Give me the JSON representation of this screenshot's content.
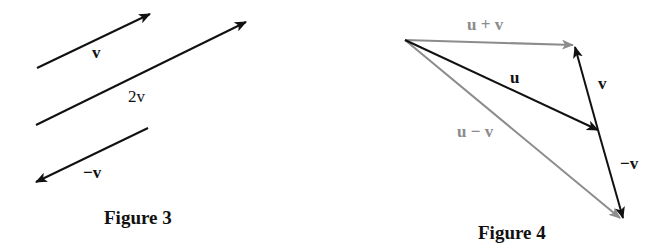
{
  "figures": [
    {
      "caption": "Figure 3",
      "vectors": [
        {
          "name": "v",
          "label": "v",
          "from": [
            37,
            68
          ],
          "to": [
            150,
            14
          ],
          "color": "#111111"
        },
        {
          "name": "2v",
          "label": "2v",
          "from": [
            36,
            125
          ],
          "to": [
            246,
            22
          ],
          "color": "#111111"
        },
        {
          "name": "neg-v",
          "label": "−v",
          "from": [
            148,
            128
          ],
          "to": [
            36,
            182
          ],
          "color": "#111111"
        }
      ]
    },
    {
      "caption": "Figure 4",
      "vectors": [
        {
          "name": "u-plus-v",
          "label": "u + v",
          "from": [
            405,
            40
          ],
          "to": [
            573,
            45
          ],
          "color": "#8c8c8c"
        },
        {
          "name": "u",
          "label": "u",
          "from": [
            405,
            40
          ],
          "to": [
            598,
            130
          ],
          "color": "#111111"
        },
        {
          "name": "v",
          "label": "v",
          "from": [
            598,
            130
          ],
          "to": [
            575,
            47
          ],
          "color": "#111111"
        },
        {
          "name": "neg-v",
          "label": "−v",
          "from": [
            598,
            130
          ],
          "to": [
            623,
            218
          ],
          "color": "#111111"
        },
        {
          "name": "u-minus-v",
          "label": "u − v",
          "from": [
            405,
            40
          ],
          "to": [
            620,
            218
          ],
          "color": "#8c8c8c"
        }
      ]
    }
  ],
  "colors": {
    "black": "#111111",
    "gray": "#8c8c8c"
  }
}
